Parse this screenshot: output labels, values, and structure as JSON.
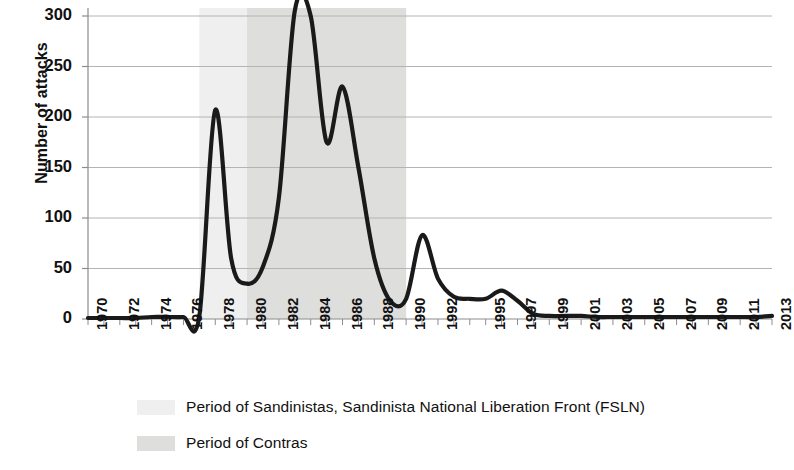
{
  "chart_data": {
    "type": "line",
    "title": "",
    "xlabel": "",
    "ylabel": "Number of attacks",
    "ylim": [
      0,
      300
    ],
    "yticks": [
      0,
      50,
      100,
      150,
      200,
      250,
      300
    ],
    "grid": true,
    "legend_position": "bottom-left",
    "xtick_labels": [
      "1970",
      "1972",
      "1974",
      "1976",
      "1978",
      "1980",
      "1982",
      "1984",
      "1986",
      "1988",
      "1990",
      "1992",
      "1995",
      "1997",
      "1999",
      "2001",
      "2003",
      "2005",
      "2007",
      "2009",
      "2011",
      "2013"
    ],
    "x": [
      1970,
      1971,
      1972,
      1973,
      1974,
      1975,
      1976,
      1977,
      1978,
      1979,
      1980,
      1981,
      1982,
      1983,
      1984,
      1985,
      1986,
      1987,
      1988,
      1989,
      1990,
      1991,
      1992,
      1993,
      1994,
      1995,
      1996,
      1997,
      1998,
      1999,
      2000,
      2001,
      2002,
      2003,
      2004,
      2005,
      2006,
      2007,
      2008,
      2009,
      2010,
      2011,
      2012,
      2013
    ],
    "values": [
      1,
      1,
      1,
      1,
      2,
      2,
      2,
      3,
      207,
      60,
      35,
      52,
      120,
      305,
      300,
      175,
      230,
      150,
      60,
      18,
      20,
      83,
      40,
      22,
      20,
      20,
      28,
      18,
      5,
      3,
      3,
      3,
      2,
      2,
      2,
      2,
      2,
      2,
      2,
      2,
      2,
      2,
      2,
      3
    ],
    "series": [
      {
        "name": "Number of attacks",
        "color": "#1a1a1a",
        "values": [
          1,
          1,
          1,
          1,
          2,
          2,
          2,
          3,
          207,
          60,
          35,
          52,
          120,
          305,
          300,
          175,
          230,
          150,
          60,
          18,
          20,
          83,
          40,
          22,
          20,
          20,
          28,
          18,
          5,
          3,
          3,
          3,
          2,
          2,
          2,
          2,
          2,
          2,
          2,
          2,
          2,
          2,
          2,
          3
        ]
      }
    ],
    "annotations": [
      {
        "name": "first-peak",
        "x": 1978,
        "y": 207
      },
      {
        "name": "main-peak",
        "x": 1983,
        "y": 305
      },
      {
        "name": "dip-1985",
        "x": 1985,
        "y": 175
      },
      {
        "name": "second-peak",
        "x": 1986,
        "y": 230
      },
      {
        "name": "post-war-peak",
        "x": 1991,
        "y": 83
      },
      {
        "name": "late-bump",
        "x": 1996,
        "y": 28
      }
    ],
    "shaded_bands": [
      {
        "name": "fsln-band",
        "label": "Period of Sandinistas, Sandinista National Liberation Front (FSLN)",
        "start": 1977,
        "end": 1990,
        "color": "#efefef"
      },
      {
        "name": "contras-band",
        "label": "Period of Contras",
        "start": 1980,
        "end": 1990,
        "color": "#dededc"
      }
    ],
    "legend": [
      {
        "label": "Period of Sandinistas, Sandinista National Liberation Front (FSLN)",
        "color": "#efefef"
      },
      {
        "label": "Period of Contras",
        "color": "#dededc"
      }
    ]
  },
  "axis": {
    "y_title": "Number of attacks",
    "y_ticks": [
      "0",
      "50",
      "100",
      "150",
      "200",
      "250",
      "300"
    ],
    "x_ticks": [
      "1970",
      "1972",
      "1974",
      "1976",
      "1978",
      "1980",
      "1982",
      "1984",
      "1986",
      "1988",
      "1990",
      "1992",
      "1995",
      "1997",
      "1999",
      "2001",
      "2003",
      "2005",
      "2007",
      "2009",
      "2011",
      "2013"
    ]
  },
  "legend": {
    "fsln_label": "Period of Sandinistas, Sandinista National Liberation Front (FSLN)",
    "contras_label": "Period of Contras"
  },
  "colors": {
    "line": "#1a1a1a",
    "grid": "#b4b4b4",
    "axis": "#808080",
    "fsln_band": "#efefef",
    "contras_band": "#dededc",
    "background": "#ffffff"
  }
}
